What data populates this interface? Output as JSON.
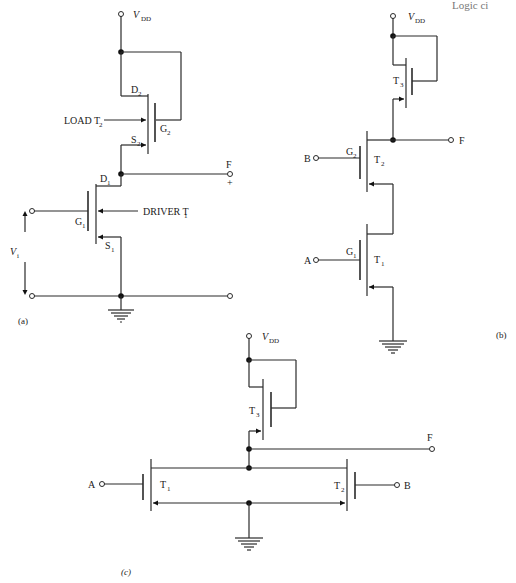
{
  "header_fragment": "Logic ci",
  "panels": {
    "a": {
      "caption": "(a)",
      "supply": {
        "label": "V",
        "sub": "DD"
      },
      "load_transistor": {
        "label": "LOAD T",
        "sub": "2",
        "drain": "D",
        "drain_sub": "2",
        "gate": "G",
        "gate_sub": "2",
        "source": "S",
        "source_sub": "2"
      },
      "driver_transistor": {
        "label": "DRIVER T",
        "sub": "1",
        "drain": "D",
        "drain_sub": "1",
        "gate": "G",
        "gate_sub": "1",
        "source": "S",
        "source_sub": "1"
      },
      "output": {
        "label": "F",
        "polarity": "+"
      },
      "input": {
        "label": "V",
        "sub": "i"
      }
    },
    "b": {
      "caption": "(b)",
      "supply": {
        "label": "V",
        "sub": "DD"
      },
      "t3": {
        "label": "T",
        "sub": "3"
      },
      "t2": {
        "label": "T",
        "sub": "2",
        "gate": "G",
        "gate_sub": "2"
      },
      "t1": {
        "label": "T",
        "sub": "1",
        "gate": "G",
        "gate_sub": "1"
      },
      "input_b": "B",
      "input_a": "A",
      "output": "F"
    },
    "c": {
      "caption": "(c)",
      "supply": {
        "label": "V",
        "sub": "DD"
      },
      "t3": {
        "label": "T",
        "sub": "3"
      },
      "t1": {
        "label": "T",
        "sub": "1"
      },
      "t2": {
        "label": "T",
        "sub": "2"
      },
      "input_a": "A",
      "input_b": "B",
      "output": "F"
    }
  }
}
